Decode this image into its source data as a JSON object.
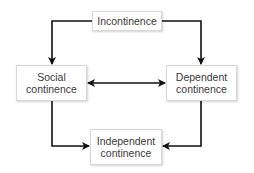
{
  "diagram": {
    "type": "flow",
    "nodes": [
      {
        "id": "incontinence",
        "label": "Incontinence"
      },
      {
        "id": "social",
        "label_line1": "Social",
        "label_line2": "continence"
      },
      {
        "id": "dependent",
        "label_line1": "Dependent",
        "label_line2": "continence"
      },
      {
        "id": "independent",
        "label_line1": "Independent",
        "label_line2": "continence"
      }
    ],
    "edges": [
      {
        "from": "incontinence",
        "to": "social",
        "direction": "one-way"
      },
      {
        "from": "incontinence",
        "to": "dependent",
        "direction": "one-way"
      },
      {
        "from": "social",
        "to": "dependent",
        "direction": "two-way"
      },
      {
        "from": "social",
        "to": "independent",
        "direction": "one-way"
      },
      {
        "from": "dependent",
        "to": "independent",
        "direction": "one-way"
      }
    ],
    "colors": {
      "arrow": "#111111",
      "box_border": "#d8d8d8",
      "text": "#3a3a3a"
    }
  }
}
